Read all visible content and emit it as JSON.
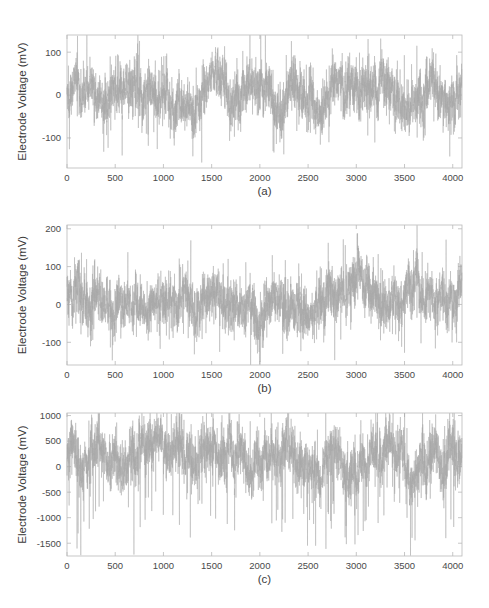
{
  "figure": {
    "background_color": "#ffffff",
    "trace_color": "#a8a8a8",
    "axis_color": "#b9b9b9",
    "text_color": "#3b3b3b",
    "panel_count": 3
  },
  "chart_data": [
    {
      "type": "line",
      "panel_id": "a",
      "caption": "(a)",
      "title": "",
      "xlabel": "(a)",
      "ylabel": "Electrode Voltage (mV)",
      "xlim": [
        0,
        4096
      ],
      "ylim": [
        -170,
        140
      ],
      "xticks": [
        0,
        500,
        1000,
        1500,
        2000,
        2500,
        3000,
        3500,
        4000
      ],
      "xticklabels": [
        "0",
        "500",
        "1000",
        "1500",
        "2000",
        "2500",
        "3000",
        "3500",
        "4000"
      ],
      "yticks": [
        100,
        0,
        -100
      ],
      "yticklabels": [
        "100",
        "0",
        "-100"
      ],
      "grid": false,
      "legend": null,
      "n_samples": 4096,
      "series": [
        {
          "name": "electrode-trace-a",
          "noise_sigma": 28,
          "baseline": 2,
          "spike_rate": 0.018,
          "spike_amplitude_pos": 105,
          "spike_amplitude_neg": -120,
          "seed": 17,
          "summary": "Dense zero-mean noisy voltage trace, peaks near +130 mV, troughs near -160 mV"
        }
      ]
    },
    {
      "type": "line",
      "panel_id": "b",
      "caption": "(b)",
      "title": "",
      "xlabel": "(b)",
      "ylabel": "Electrode Voltage (mV)",
      "xlim": [
        0,
        4096
      ],
      "ylim": [
        -160,
        210
      ],
      "xticks": [
        0,
        500,
        1000,
        1500,
        2000,
        2500,
        3000,
        3500,
        4000
      ],
      "xticklabels": [
        "0",
        "500",
        "1000",
        "1500",
        "2000",
        "2500",
        "3000",
        "3500",
        "4000"
      ],
      "yticks": [
        200,
        100,
        0,
        -100
      ],
      "yticklabels": [
        "200",
        "100",
        "0",
        "-100"
      ],
      "grid": false,
      "legend": null,
      "n_samples": 4096,
      "series": [
        {
          "name": "electrode-trace-b",
          "noise_sigma": 32,
          "baseline": 14,
          "spike_rate": 0.02,
          "spike_amplitude_pos": 125,
          "spike_amplitude_neg": -115,
          "seed": 43,
          "summary": "Noisy trace with positive offset, largest burst near sample 3200 reaching +185 mV"
        }
      ]
    },
    {
      "type": "line",
      "panel_id": "c",
      "caption": "(c)",
      "title": "",
      "xlabel": "(c)",
      "ylabel": "Electrode Voltage (mV)",
      "xlim": [
        0,
        4096
      ],
      "ylim": [
        -1750,
        1050
      ],
      "xticks": [
        0,
        500,
        1000,
        1500,
        2000,
        2500,
        3000,
        3500,
        4000
      ],
      "xticklabels": [
        "0",
        "500",
        "1000",
        "1500",
        "2000",
        "2500",
        "3000",
        "3500",
        "4000"
      ],
      "yticks": [
        1000,
        500,
        0,
        -500,
        -1000,
        -1500
      ],
      "yticklabels": [
        "1000",
        "500",
        "0",
        "-500",
        "-1000",
        "-1500"
      ],
      "grid": false,
      "legend": null,
      "n_samples": 4096,
      "series": [
        {
          "name": "electrode-trace-c",
          "noise_sigma": 230,
          "baseline": 180,
          "spike_rate": 0.05,
          "spike_amplitude_pos": 820,
          "spike_amplitude_neg": -1600,
          "seed": 91,
          "summary": "High-amplitude trace with frequent deep negative spikes down to about -1700 mV and positive peaks near +950 mV"
        }
      ]
    }
  ]
}
